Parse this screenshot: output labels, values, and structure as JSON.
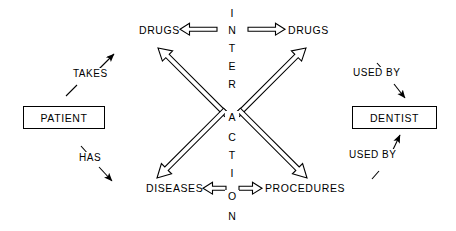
{
  "diagram": {
    "background_color": "#ffffff",
    "stroke_color": "#000000",
    "entities": [
      {
        "id": "patient",
        "label": "PATIENT",
        "shape": "rectangle"
      },
      {
        "id": "dentist",
        "label": "DENTIST",
        "shape": "rectangle"
      }
    ],
    "nodes": [
      {
        "id": "drugs_left",
        "label": "DRUGS"
      },
      {
        "id": "drugs_right",
        "label": "DRUGS"
      },
      {
        "id": "diseases",
        "label": "DISEASES"
      },
      {
        "id": "procedures",
        "label": "PROCEDURES"
      }
    ],
    "center": {
      "word": "INTERACTION",
      "letters": [
        "I",
        "N",
        "T",
        "E",
        "R",
        "A",
        "C",
        "T",
        "I",
        "O",
        "N"
      ],
      "hub_letter": "A"
    },
    "relationships": [
      {
        "id": "takes",
        "label": "TAKES",
        "from": "patient",
        "to": "drugs_left",
        "arrow": "filled",
        "direction": "up-right"
      },
      {
        "id": "has",
        "label": "HAS",
        "from": "patient",
        "to": "diseases",
        "arrow": "filled",
        "direction": "down-right"
      },
      {
        "id": "used_by_top",
        "label": "USED BY",
        "from": "drugs_right",
        "to": "dentist",
        "arrow": "filled",
        "direction": "down-right"
      },
      {
        "id": "used_by_bot",
        "label": "USED BY",
        "from": "procedures",
        "to": "dentist",
        "arrow": "filled",
        "direction": "up-right"
      }
    ],
    "interaction_arrows": [
      {
        "id": "drugs-drugs",
        "style": "hollow-double-headed",
        "orientation": "horizontal-top"
      },
      {
        "id": "diseases-procedures",
        "style": "hollow-double-headed",
        "orientation": "horizontal-bottom"
      },
      {
        "id": "hub-drugs-left",
        "style": "hollow-single-headed",
        "orientation": "diagonal-up-left"
      },
      {
        "id": "hub-drugs-right",
        "style": "hollow-single-headed",
        "orientation": "diagonal-up-right"
      },
      {
        "id": "hub-diseases",
        "style": "hollow-single-headed",
        "orientation": "diagonal-down-left"
      },
      {
        "id": "hub-procedures",
        "style": "hollow-single-headed",
        "orientation": "diagonal-down-right"
      }
    ]
  }
}
